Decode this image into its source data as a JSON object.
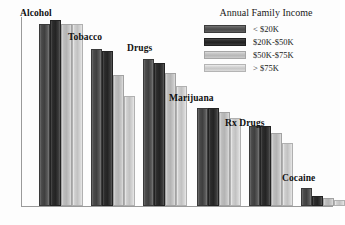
{
  "chart_data": {
    "type": "bar",
    "title": "",
    "xlabel": "",
    "ylabel": "",
    "grid": false,
    "legend_position": "top-right",
    "legend_title": "Annual Family Income",
    "categories": [
      "Alcohol",
      "Tobacco",
      "Drugs",
      "Marijuana",
      "Rx Drugs",
      "Cocaine"
    ],
    "ylim": [
      0,
      100
    ],
    "series": [
      {
        "name": "< $20K",
        "color": "#4b4b4b",
        "values": [
          93,
          80,
          75,
          50,
          41,
          9
        ]
      },
      {
        "name": "$20K-$50K",
        "color": "#242424",
        "values": [
          95,
          79,
          73,
          50,
          41,
          5
        ]
      },
      {
        "name": "$50K-$75K",
        "color": "#b8b8b8",
        "values": [
          93,
          67,
          68,
          48,
          37,
          4
        ]
      },
      {
        "name": "> $75K",
        "color": "#c8c8c8",
        "values": [
          93,
          56,
          61,
          45,
          32,
          3
        ]
      }
    ]
  },
  "legend": {
    "title": "Annual Family Income",
    "items": [
      {
        "label": "< $20K"
      },
      {
        "label": "$20K-$50K"
      },
      {
        "label": "$50K-$75K"
      },
      {
        "label": "> $75K"
      }
    ]
  },
  "groups": [
    {
      "label": "Alcohol",
      "left": 18,
      "label_left": 20,
      "label_top": 8
    },
    {
      "label": "Tobacco",
      "left": 70,
      "label_left": 68,
      "label_top": 32
    },
    {
      "label": "Drugs",
      "left": 122,
      "label_left": 127,
      "label_top": 43
    },
    {
      "label": "Marijuana",
      "left": 176,
      "label_left": 169,
      "label_top": 93
    },
    {
      "label": "Rx Drugs",
      "left": 228,
      "label_left": 225,
      "label_top": 118
    },
    {
      "label": "Cocaine",
      "left": 280,
      "label_left": 282,
      "label_top": 173
    }
  ]
}
